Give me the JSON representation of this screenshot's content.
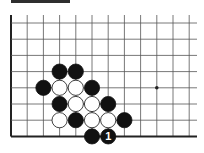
{
  "header": {
    "label": ""
  },
  "board": {
    "columns": 12,
    "rows": 8,
    "edges": [
      "left",
      "bottom"
    ],
    "star_points": [
      {
        "col": 9,
        "row": 4
      }
    ],
    "stones": [
      {
        "color": "black",
        "col": 3,
        "row": 3
      },
      {
        "color": "black",
        "col": 4,
        "row": 3
      },
      {
        "color": "black",
        "col": 2,
        "row": 4
      },
      {
        "color": "white",
        "col": 3,
        "row": 4
      },
      {
        "color": "white",
        "col": 4,
        "row": 4
      },
      {
        "color": "black",
        "col": 5,
        "row": 4
      },
      {
        "color": "black",
        "col": 3,
        "row": 5
      },
      {
        "color": "white",
        "col": 4,
        "row": 5
      },
      {
        "color": "white",
        "col": 5,
        "row": 5
      },
      {
        "color": "black",
        "col": 6,
        "row": 5
      },
      {
        "color": "white",
        "col": 3,
        "row": 6
      },
      {
        "color": "black",
        "col": 4,
        "row": 6
      },
      {
        "color": "white",
        "col": 5,
        "row": 6
      },
      {
        "color": "white",
        "col": 6,
        "row": 6
      },
      {
        "color": "black",
        "col": 7,
        "row": 6
      },
      {
        "color": "black",
        "col": 5,
        "row": 7
      },
      {
        "color": "black",
        "col": 6,
        "row": 7,
        "marker": "1"
      }
    ],
    "colors": {
      "black": "#111111",
      "white": "#ffffff",
      "line": "#555555",
      "edge": "#222222"
    }
  }
}
